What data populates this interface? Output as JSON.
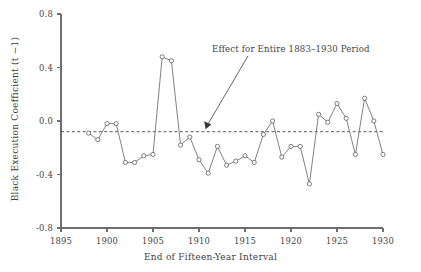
{
  "chart_data": {
    "type": "line",
    "title": "",
    "xlabel": "End of Fifteen-Year Interval",
    "ylabel": "Black Execution Coefficient (t −1)",
    "xlim": [
      1895,
      1930
    ],
    "ylim": [
      -0.8,
      0.8
    ],
    "xticks": [
      1895,
      1900,
      1905,
      1910,
      1915,
      1920,
      1925,
      1930
    ],
    "xtick_labels": [
      "1895",
      "1900",
      "1905",
      "1910",
      "1915",
      "1920",
      "1925",
      "1930"
    ],
    "yticks": [
      0.8,
      0.4,
      0.0,
      -0.4,
      -0.8
    ],
    "ytick_labels": [
      "0.8",
      "0.4",
      "0.0",
      "-0.4",
      "-0.8"
    ],
    "grid": false,
    "legend": "none",
    "marker": "open-circle",
    "line_color": "#6b6b6b",
    "marker_face_color": "#ffffff",
    "marker_edge_color": "#5d5d5d",
    "x": [
      1898,
      1899,
      1900,
      1901,
      1902,
      1903,
      1904,
      1905,
      1906,
      1907,
      1908,
      1909,
      1910,
      1911,
      1912,
      1913,
      1914,
      1915,
      1916,
      1917,
      1918,
      1919,
      1920,
      1921,
      1922,
      1923,
      1924,
      1925,
      1926,
      1927,
      1928,
      1929,
      1930
    ],
    "values": [
      -0.09,
      -0.14,
      -0.02,
      -0.02,
      -0.31,
      -0.31,
      -0.26,
      -0.25,
      0.48,
      0.45,
      -0.18,
      -0.12,
      -0.29,
      -0.39,
      -0.19,
      -0.33,
      -0.3,
      -0.26,
      -0.31,
      -0.1,
      0.0,
      -0.27,
      -0.19,
      -0.19,
      -0.47,
      0.05,
      -0.01,
      0.13,
      0.02,
      -0.25,
      0.17,
      0.0,
      -0.25
    ],
    "reference_line": {
      "value": -0.08,
      "style": "dashed",
      "label": "Effect for Entire 1883–1930 Period"
    },
    "annotation": {
      "text": "Effect for Entire 1883–1930 Period",
      "points_to_x": 1909.8,
      "points_to_y": -0.08
    }
  }
}
